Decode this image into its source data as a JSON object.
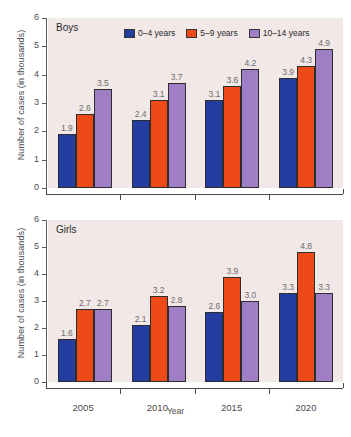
{
  "chart_data": {
    "type": "bar",
    "title": "",
    "xlabel": "Year",
    "ylabel": "Number of cases (in thousands)",
    "categories": [
      "2005",
      "2010",
      "2015",
      "2020"
    ],
    "ylim": [
      0,
      6
    ],
    "yticks": [
      "0",
      "1",
      "2",
      "3",
      "4",
      "5",
      "6"
    ],
    "grid": false,
    "legend_position": "top-right-inside",
    "legend": [
      "0–4 years",
      "5–9 years",
      "10–14 years"
    ],
    "panels": [
      {
        "label": "Boys",
        "series": [
          {
            "name": "0–4 years",
            "color": "#243da0",
            "values": [
              1.9,
              2.4,
              3.1,
              3.9
            ]
          },
          {
            "name": "5–9 years",
            "color": "#ee4a18",
            "values": [
              2.6,
              3.1,
              3.6,
              4.3
            ]
          },
          {
            "name": "10–14 years",
            "color": "#a07ec6",
            "values": [
              3.5,
              3.7,
              4.2,
              4.9
            ]
          }
        ]
      },
      {
        "label": "Girls",
        "series": [
          {
            "name": "0–4 years",
            "color": "#243da0",
            "values": [
              1.6,
              2.1,
              2.6,
              3.3
            ]
          },
          {
            "name": "5–9 years",
            "color": "#ee4a18",
            "values": [
              2.7,
              3.2,
              3.9,
              4.8
            ]
          },
          {
            "name": "10–14 years",
            "color": "#a07ec6",
            "values": [
              2.7,
              2.8,
              3.0,
              3.3
            ]
          }
        ]
      }
    ],
    "data_labels": {
      "boys": {
        "2005": [
          "1.9",
          "2.6",
          "3.5"
        ],
        "2010": [
          "2.4",
          "3.1",
          "3.7"
        ],
        "2015": [
          "3.1",
          "3.6",
          "4.2"
        ],
        "2020": [
          "3.9",
          "4.3",
          "4.9"
        ]
      },
      "girls": {
        "2005": [
          "1.6",
          "2.7",
          "2.7"
        ],
        "2010": [
          "2.1",
          "3.2",
          "2.8"
        ],
        "2015": [
          "2.6",
          "3.9",
          "3.0"
        ],
        "2020": [
          "3.3",
          "4.8",
          "3.3"
        ]
      }
    }
  },
  "colors": {
    "series_0_4": "#243da0",
    "series_5_9": "#ee4a18",
    "series_10_14": "#a07ec6",
    "plot_background": "#f1e8e7",
    "page_background": "#ffffff",
    "axis": "#4a4a4a",
    "label_text": "#6c6c6c"
  },
  "caption": ""
}
